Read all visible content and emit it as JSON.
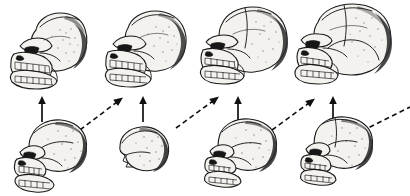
{
  "figure": {
    "title": "Hominid Cranial Evolution Sequence",
    "background_color": "#ffffff",
    "ink_color": "#101010",
    "bone_color": "#f4f2ee",
    "shadow_color": "#2a2a2a",
    "width": 410,
    "height": 196,
    "rows": 2,
    "columns": 4
  },
  "reconstructed_skulls": [
    {
      "index": 1,
      "name": "reconstruction-stage-1",
      "stage_label": "Stage 1",
      "cranial_profile": "low vault, heavy continuous browridge, strong prognathic muzzle, sagittal crest",
      "relative_braincase_size": "smallest",
      "center_x": 48,
      "center_y": 50
    },
    {
      "index": 2,
      "name": "reconstruction-stage-2",
      "stage_label": "Stage 2",
      "cranial_profile": "slightly raised vault, pronounced browridge, reduced muzzle",
      "relative_braincase_size": "small",
      "center_x": 145,
      "center_y": 48
    },
    {
      "index": 3,
      "name": "reconstruction-stage-3",
      "stage_label": "Stage 3",
      "cranial_profile": "expanded rounded vault, moderate browridge, shortened face",
      "relative_braincase_size": "large",
      "center_x": 243,
      "center_y": 46
    },
    {
      "index": 4,
      "name": "reconstruction-stage-4",
      "stage_label": "Stage 4",
      "cranial_profile": "globular high vault, vertical forehead, gracile face, chin present",
      "relative_braincase_size": "largest",
      "center_x": 344,
      "center_y": 46
    }
  ],
  "fossil_specimens": [
    {
      "index": 1,
      "name": "fossil-specimen-1",
      "stage_label": "Stage 1 fossil",
      "completeness": "near-complete cranium with mandible",
      "center_x": 50,
      "center_y": 155
    },
    {
      "index": 2,
      "name": "fossil-specimen-2",
      "stage_label": "Stage 2 fossil",
      "completeness": "partial calvarium fragment only",
      "center_x": 143,
      "center_y": 147
    },
    {
      "index": 3,
      "name": "fossil-specimen-3",
      "stage_label": "Stage 3 fossil",
      "completeness": "cranium with partial upper jaw",
      "center_x": 239,
      "center_y": 152
    },
    {
      "index": 4,
      "name": "fossil-specimen-4",
      "stage_label": "Stage 4 fossil",
      "completeness": "cranium with partial facial skeleton",
      "center_x": 335,
      "center_y": 150
    }
  ],
  "vertical_arrows": [
    {
      "index": 1,
      "name": "vertical-arrow-1",
      "style": "solid",
      "direction": "up",
      "x": 42,
      "y_tail": 122,
      "y_head": 98,
      "meaning": "fossil to reconstruction"
    },
    {
      "index": 2,
      "name": "vertical-arrow-2",
      "style": "solid",
      "direction": "up",
      "x": 143,
      "y_tail": 122,
      "y_head": 98,
      "meaning": "fossil to reconstruction"
    },
    {
      "index": 3,
      "name": "vertical-arrow-3",
      "style": "solid",
      "direction": "up",
      "x": 238,
      "y_tail": 122,
      "y_head": 98,
      "meaning": "fossil to reconstruction"
    },
    {
      "index": 4,
      "name": "vertical-arrow-4",
      "style": "solid",
      "direction": "up",
      "x": 333,
      "y_tail": 122,
      "y_head": 98,
      "meaning": "fossil to reconstruction"
    }
  ],
  "diagonal_arrows": [
    {
      "index": 1,
      "name": "diagonal-arrow-1",
      "style": "dashed",
      "direction": "up-right",
      "x_tail": 80,
      "y_tail": 130,
      "x_head": 122,
      "y_head": 98,
      "meaning": "evolutionary succession stage 1 to 2"
    },
    {
      "index": 2,
      "name": "diagonal-arrow-2",
      "style": "dashed",
      "direction": "up-right",
      "x_tail": 176,
      "y_tail": 128,
      "x_head": 218,
      "y_head": 98,
      "meaning": "evolutionary succession stage 2 to 3"
    },
    {
      "index": 3,
      "name": "diagonal-arrow-3",
      "style": "dashed",
      "direction": "up-right",
      "x_tail": 272,
      "y_tail": 130,
      "x_head": 314,
      "y_head": 99,
      "meaning": "evolutionary succession stage 3 to 4"
    },
    {
      "index": 4,
      "name": "diagonal-arrow-4",
      "style": "dashed",
      "direction": "up-right",
      "x_tail": 362,
      "y_tail": 131,
      "x_head": 410,
      "y_head": 108,
      "meaning": "evolutionary succession continuing beyond frame"
    }
  ]
}
